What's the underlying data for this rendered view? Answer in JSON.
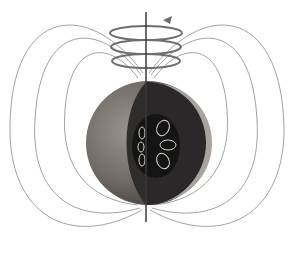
{
  "diagram": {
    "colors": {
      "background": "#ffffff",
      "field_line": "#8a8a8a",
      "ring": "#6e6e6e",
      "axis": "#3a3a3a",
      "crust": "#7a7570",
      "mantle": "#2f2d2c",
      "core": "#151414",
      "convection_cell": "#d8d4cc"
    },
    "elements": {
      "planet": {
        "cx": 148,
        "cy": 143,
        "r": 62
      },
      "axis": {
        "x": 146,
        "y1": 12,
        "y2": 222
      },
      "rotation_rings": [
        {
          "cy": 33
        },
        {
          "cy": 47
        },
        {
          "cy": 61
        }
      ],
      "rotation_arrow": {
        "x": 167,
        "y": 20,
        "direction": "counterclockwise"
      },
      "field_line_pairs": 3,
      "core_convection_cells": 6
    }
  }
}
